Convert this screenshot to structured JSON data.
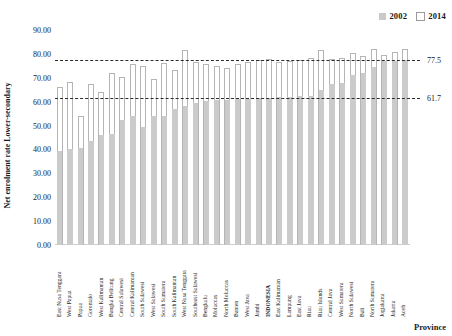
{
  "chart_data": {
    "type": "bar",
    "title": "",
    "xlabel": "Province",
    "ylabel": "Net enrolment rate Lower-secondary",
    "ylim": [
      0,
      90
    ],
    "ytick_step": 10,
    "ytick_labels": [
      "0.00",
      "10.00",
      "20.00",
      "30.00",
      "40.00",
      "50.00",
      "60.00",
      "70.00",
      "80.00",
      "90.00"
    ],
    "grid": false,
    "legend_position": "top-right",
    "categories": [
      "East Nusa Tenggara",
      "West Papua",
      "Papua",
      "Gorontalo",
      "West Kalimantan",
      "Bangka Belitung",
      "Central Sulawesi",
      "Central Kalimantan",
      "South Sulawesi",
      "West Sulawesi",
      "South Sumatera",
      "South Kalimantan",
      "West Nusa Tenggara",
      "Southeast Sulawesi",
      "Bengkulu",
      "Moluccas",
      "North Moluccas",
      "Banten",
      "West Java",
      "Jambi",
      "INDONESIA",
      "East Kalimantan",
      "Lampung",
      "East Java",
      "Riau",
      "Riau Islands",
      "Central Java",
      "West Sumatera",
      "North Sulawesi",
      "Bali",
      "North Sumatera",
      "Jogjakarta",
      "Jakarta",
      "Aceh"
    ],
    "series": [
      {
        "name": "2002",
        "color": "#cbcbcb",
        "values": [
          39.2,
          40.1,
          40.5,
          43.4,
          46.2,
          46.5,
          52.3,
          54.0,
          49.2,
          54.0,
          54.0,
          56.8,
          58.2,
          59.4,
          60.2,
          60.6,
          60.8,
          61.0,
          61.3,
          61.5,
          61.7,
          61.8,
          62.0,
          62.2,
          62.4,
          65.0,
          67.5,
          67.9,
          71.0,
          72.0,
          74.5,
          76.9,
          77.2,
          77.4
        ]
      },
      {
        "name": "2014",
        "color": "#ffffff",
        "values": [
          66.2,
          68.2,
          54.0,
          67.4,
          64.2,
          71.8,
          70.4,
          75.9,
          75.0,
          69.6,
          76.0,
          73.2,
          81.5,
          76.8,
          75.8,
          75.0,
          74.0,
          75.6,
          76.6,
          77.5,
          77.8,
          76.5,
          77.0,
          77.6,
          78.1,
          81.5,
          78.0,
          78.2,
          80.5,
          79.0,
          82.0,
          79.6,
          80.8,
          82.0
        ]
      }
    ],
    "reference_lines": [
      {
        "value": 77.5,
        "label": "77.5",
        "style": "dashed"
      },
      {
        "value": 61.7,
        "label": "61.7",
        "style": "dashed"
      }
    ],
    "highlight_category": "INDONESIA"
  },
  "legend": {
    "items": [
      {
        "label": "2002",
        "swatch": "filled-gray-square"
      },
      {
        "label": "2014",
        "swatch": "outlined-white-square"
      }
    ]
  }
}
